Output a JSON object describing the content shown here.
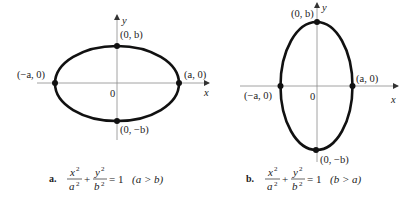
{
  "panels": [
    {
      "id": "a",
      "caption_letter": "a.",
      "equation": {
        "num1": "x",
        "den1": "a",
        "num2": "y",
        "den2": "b",
        "exp": "2",
        "plus": "+",
        "equals": "= 1",
        "condition": "(a > b)"
      },
      "axis_labels": {
        "x": "x",
        "y": "y",
        "origin": "0"
      },
      "points": {
        "top": "(0, b)",
        "bottom": "(0, −b)",
        "left": "(−a, 0)",
        "right": "(a, 0)"
      },
      "geometry": {
        "cx": 117,
        "cy": 83,
        "rx": 62,
        "ry": 37.5
      }
    },
    {
      "id": "b",
      "caption_letter": "b.",
      "equation": {
        "num1": "x",
        "den1": "a",
        "num2": "y",
        "den2": "b",
        "exp": "2",
        "plus": "+",
        "equals": "= 1",
        "condition": "(b > a)"
      },
      "axis_labels": {
        "x": "x",
        "y": "y",
        "origin": "0"
      },
      "points": {
        "top": "(0, b)",
        "bottom": "(0, −b)",
        "left": "(−a, 0)",
        "right": "(a, 0)"
      },
      "geometry": {
        "cx": 316.5,
        "cy": 86,
        "rx": 36,
        "ry": 64
      }
    }
  ],
  "colors": {
    "curve": "#111111",
    "axis": "#7a7a7a",
    "text": "#222222"
  }
}
